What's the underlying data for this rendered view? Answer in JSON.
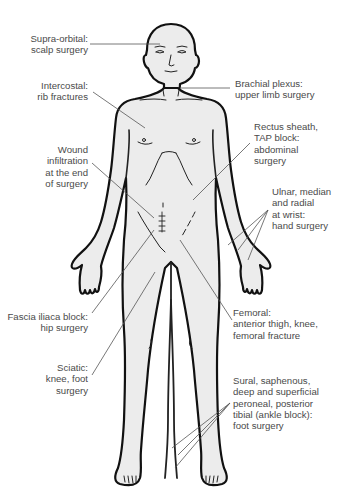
{
  "diagram": {
    "labels": {
      "supra_orbital": [
        "Supra-orbital:",
        "scalp surgery"
      ],
      "intercostal": [
        "Intercostal:",
        "rib fractures"
      ],
      "wound_infiltration": [
        "Wound",
        "infiltration",
        "at the end",
        "of surgery"
      ],
      "fascia_iliaca": [
        "Fascia iliaca block:",
        "hip surgery"
      ],
      "sciatic": [
        "Sciatic:",
        "knee, foot",
        "surgery"
      ],
      "brachial_plexus": [
        "Brachial plexus:",
        "upper limb surgery"
      ],
      "rectus_sheath": [
        "Rectus sheath,",
        "TAP block:",
        "abdominal",
        "surgery"
      ],
      "wrist": [
        "Ulnar, median",
        "and radial",
        "at wrist:",
        "hand surgery"
      ],
      "femoral": [
        "Femoral:",
        "anterior thigh, knee,",
        "femoral fracture"
      ],
      "ankle": [
        "Sural, saphenous,",
        "deep and superficial",
        "peroneal, posterior",
        "tibial (ankle block):",
        "foot surgery"
      ]
    },
    "colors": {
      "skin_fill": "#ececec",
      "outline": "#111111",
      "label_text": "#4a4a4a",
      "leader_line": "#555555"
    }
  }
}
